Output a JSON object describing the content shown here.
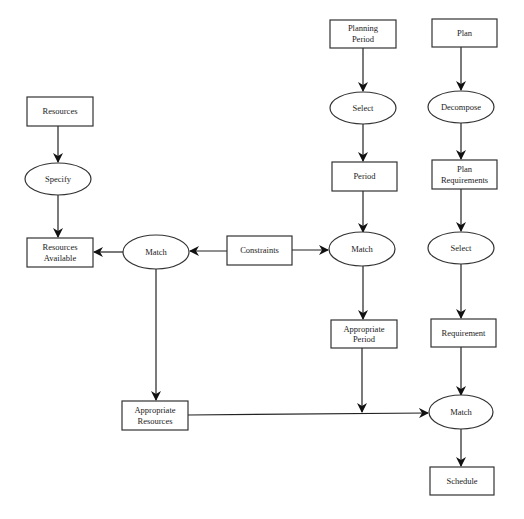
{
  "diagram": {
    "type": "data-flow",
    "nodes": {
      "resources": {
        "label_lines": [
          "Resources"
        ],
        "shape": "rect"
      },
      "specify": {
        "label_lines": [
          "Specify"
        ],
        "shape": "ellipse"
      },
      "resources_available": {
        "label_lines": [
          "Resources",
          "Available"
        ],
        "shape": "rect"
      },
      "match_left": {
        "label_lines": [
          "Match"
        ],
        "shape": "ellipse"
      },
      "constraints": {
        "label_lines": [
          "Constraints"
        ],
        "shape": "rect"
      },
      "match_mid": {
        "label_lines": [
          "Match"
        ],
        "shape": "ellipse"
      },
      "planning_period": {
        "label_lines": [
          "Planning",
          "Period"
        ],
        "shape": "rect"
      },
      "select_mid": {
        "label_lines": [
          "Select"
        ],
        "shape": "ellipse"
      },
      "period": {
        "label_lines": [
          "Period"
        ],
        "shape": "rect"
      },
      "appropriate_period": {
        "label_lines": [
          "Appropriate",
          "Period"
        ],
        "shape": "rect"
      },
      "plan": {
        "label_lines": [
          "Plan"
        ],
        "shape": "rect"
      },
      "decompose": {
        "label_lines": [
          "Decompose"
        ],
        "shape": "ellipse"
      },
      "plan_requirements": {
        "label_lines": [
          "Plan",
          "Requirements"
        ],
        "shape": "rect"
      },
      "select_right": {
        "label_lines": [
          "Select"
        ],
        "shape": "ellipse"
      },
      "requirement": {
        "label_lines": [
          "Requirement"
        ],
        "shape": "rect"
      },
      "match_bottom": {
        "label_lines": [
          "Match"
        ],
        "shape": "ellipse"
      },
      "schedule": {
        "label_lines": [
          "Schedule"
        ],
        "shape": "rect"
      },
      "appropriate_resources": {
        "label_lines": [
          "Appropriate",
          "Resources"
        ],
        "shape": "rect"
      }
    },
    "edges": [
      {
        "from": "Resources",
        "to": "Specify"
      },
      {
        "from": "Specify",
        "to": "Resources Available"
      },
      {
        "from": "Match (left)",
        "to": "Resources Available"
      },
      {
        "from": "Constraints",
        "to": "Match (left)"
      },
      {
        "from": "Constraints",
        "to": "Match (mid)"
      },
      {
        "from": "Planning Period",
        "to": "Select (mid)"
      },
      {
        "from": "Select (mid)",
        "to": "Period"
      },
      {
        "from": "Period",
        "to": "Match (mid)"
      },
      {
        "from": "Match (mid)",
        "to": "Appropriate Period"
      },
      {
        "from": "Appropriate Period",
        "to": "Match (bottom)"
      },
      {
        "from": "Match (left)",
        "to": "Appropriate Resources"
      },
      {
        "from": "Appropriate Resources",
        "to": "Match (bottom)"
      },
      {
        "from": "Plan",
        "to": "Decompose"
      },
      {
        "from": "Decompose",
        "to": "Plan Requirements"
      },
      {
        "from": "Plan Requirements",
        "to": "Select (right)"
      },
      {
        "from": "Select (right)",
        "to": "Requirement"
      },
      {
        "from": "Requirement",
        "to": "Match (bottom)"
      },
      {
        "from": "Match (bottom)",
        "to": "Schedule"
      }
    ]
  }
}
